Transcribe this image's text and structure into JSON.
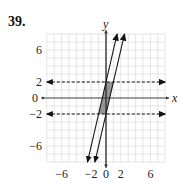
{
  "problem_number": "39.",
  "chart_data": {
    "type": "line",
    "title": "",
    "xlabel": "x",
    "ylabel": "y",
    "xlim": [
      -8,
      8
    ],
    "ylim": [
      -8,
      8
    ],
    "grid": true,
    "x_ticks": [
      -6,
      -2,
      0,
      2,
      6
    ],
    "y_ticks": [
      6,
      2,
      0,
      -2,
      -6
    ],
    "x_tick_labels": [
      "−6",
      "−2",
      "0",
      "2",
      "6"
    ],
    "y_tick_labels": [
      "6",
      "2",
      "0",
      "−2",
      "−6"
    ],
    "series": [
      {
        "name": "y = 2",
        "style": "dashed",
        "equation": "y=2",
        "points": [
          [
            -8,
            2
          ],
          [
            8,
            2
          ]
        ]
      },
      {
        "name": "y = -2",
        "style": "dashed",
        "equation": "y=-2",
        "points": [
          [
            -8,
            -2
          ],
          [
            8,
            -2
          ]
        ]
      },
      {
        "name": "y = 4x + 2",
        "style": "solid",
        "equation": "y=4x+2",
        "points": [
          [
            -2.5,
            -8
          ],
          [
            1.5,
            8
          ]
        ]
      },
      {
        "name": "y = 4x - 2",
        "style": "solid",
        "equation": "y=4x-2",
        "points": [
          [
            -1.5,
            -8
          ],
          [
            2.5,
            8
          ]
        ]
      }
    ],
    "shaded_region": {
      "vertices": [
        [
          -1,
          -2
        ],
        [
          0,
          -2
        ],
        [
          1,
          2
        ],
        [
          0,
          2
        ]
      ],
      "color": "#8a8a8a"
    }
  }
}
